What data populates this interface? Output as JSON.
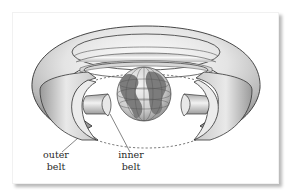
{
  "figure": {
    "labels": {
      "outer_belt": [
        "outer",
        "belt"
      ],
      "inner_belt": [
        "inner",
        "belt"
      ]
    }
  },
  "colors": {
    "background": "#ffffff",
    "belt_light": "#f6f6f6",
    "belt_dark": "#9a9a9a",
    "cross_section": "#ececec",
    "outline": "#333333",
    "globe_ocean": "#d8d8d8",
    "globe_land": "#7a7a7a",
    "text": "#2a2a2a"
  }
}
